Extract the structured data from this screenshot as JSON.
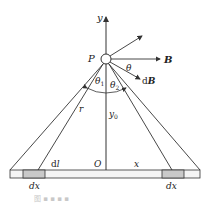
{
  "labels": {
    "y_axis": "y",
    "point": "P",
    "field": "B",
    "theta": "θ",
    "dfield_d": "d",
    "dfield_B": "B",
    "theta1": "θ",
    "theta1_sub": "1",
    "theta2": "θ",
    "theta2_sub": "2",
    "r": "r",
    "y0": "y",
    "y0_sub": "0",
    "dl_d": "d",
    "dl_l": "l",
    "origin": "O",
    "x": "x",
    "dx_left": "dx",
    "dx_right": "dx"
  },
  "caption": "图 ▪ ▪ ▪ ▪",
  "colors": {
    "line": "#333333",
    "bar_fill": "#f4f4f4",
    "segment_fill": "#c9c9c9",
    "caption": "#c8c8c8"
  }
}
